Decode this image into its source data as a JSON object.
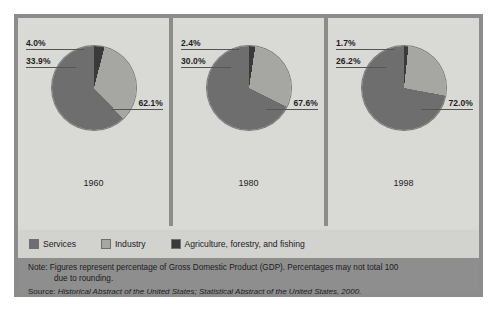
{
  "chart_data": {
    "type": "pie",
    "title": "",
    "categories": [
      "Services",
      "Industry",
      "Agriculture, forestry, and fishing"
    ],
    "colors": [
      "#6e6e6e",
      "#a6a6a2",
      "#3a3a3a"
    ],
    "charts": [
      {
        "label": "1960",
        "slices": [
          {
            "name": "Agriculture, forestry, and fishing",
            "value": 4.0,
            "display": "4.0%"
          },
          {
            "name": "Industry",
            "value": 33.9,
            "display": "33.9%"
          },
          {
            "name": "Services",
            "value": 62.1,
            "display": "62.1%"
          }
        ]
      },
      {
        "label": "1980",
        "slices": [
          {
            "name": "Agriculture, forestry, and fishing",
            "value": 2.4,
            "display": "2.4%"
          },
          {
            "name": "Industry",
            "value": 30.0,
            "display": "30.0%"
          },
          {
            "name": "Services",
            "value": 67.6,
            "display": "67.6%"
          }
        ]
      },
      {
        "label": "1998",
        "slices": [
          {
            "name": "Agriculture, forestry, and fishing",
            "value": 1.7,
            "display": "1.7%"
          },
          {
            "name": "Industry",
            "value": 26.2,
            "display": "26.2%"
          },
          {
            "name": "Services",
            "value": 72.0,
            "display": "72.0%"
          }
        ]
      }
    ],
    "legend": [
      "Services",
      "Industry",
      "Agriculture, forestry, and fishing"
    ],
    "legend_position": "bottom",
    "xlabel": "",
    "ylabel": "",
    "annotations": [
      "Note: Figures represent percentage of Gross Domestic Product (GDP). Percentages may not total 100 due to rounding.",
      "Source: Historical Abstract of the United States; Statistical Abstract of the United States, 2000."
    ]
  },
  "panels": [
    {
      "year": "1960",
      "agriculture": "4.0%",
      "industry": "33.9%",
      "services": "62.1%"
    },
    {
      "year": "1980",
      "agriculture": "2.4%",
      "industry": "30.0%",
      "services": "67.6%"
    },
    {
      "year": "1998",
      "agriculture": "1.7%",
      "industry": "26.2%",
      "services": "72.0%"
    }
  ],
  "legend": {
    "services": "Services",
    "industry": "Industry",
    "agriculture": "Agriculture, forestry, and fishing"
  },
  "notes": {
    "line1": "Note: Figures represent percentage of Gross Domestic Product (GDP). Percentages may not total 100",
    "line2": "due to rounding.",
    "source_label": "Source: ",
    "source_title": "Historical Abstract of the United States; Statistical Abstract of the United States, 2000."
  },
  "colors": {
    "services": "#6e6e6e",
    "industry": "#a6a6a2",
    "agriculture": "#3a3a3a",
    "panel_bg": "#d9d9d5",
    "frame": "#8c8c8c",
    "note_bg": "#8e8e8e",
    "legend_bg": "#d2d2ce"
  }
}
